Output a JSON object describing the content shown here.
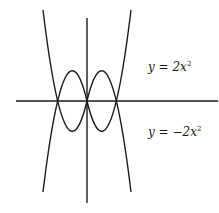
{
  "diagram": {
    "type": "function-graph",
    "axes": {
      "horizontal": "x-axis",
      "vertical": "y-axis"
    },
    "curves": [
      {
        "id": "upper",
        "equation": "y = 2x^2",
        "label_prefix": "y = 2x",
        "exponent": "2",
        "opens": "up"
      },
      {
        "id": "lower",
        "equation": "y = -2x^2",
        "label_prefix": "y = −2x",
        "exponent": "2",
        "opens": "down"
      }
    ],
    "colors": {
      "stroke": "#1a1a1a",
      "background": "#ffffff"
    }
  }
}
